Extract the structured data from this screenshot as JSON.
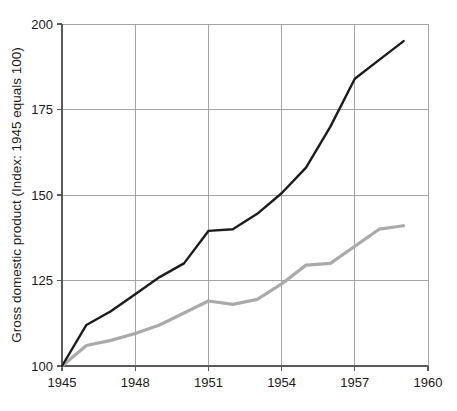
{
  "chart_data": {
    "type": "line",
    "title": "",
    "subtitle": "",
    "xlabel": "",
    "ylabel": "Gross domestic product (Index: 1945 equals 100)",
    "xlim": [
      1945,
      1960
    ],
    "ylim": [
      100,
      200
    ],
    "grid": true,
    "legend": "none",
    "x_ticks": [
      "1945",
      "1948",
      "1951",
      "1954",
      "1957",
      "1960"
    ],
    "x_tick_values": [
      1945,
      1948,
      1951,
      1954,
      1957,
      1960
    ],
    "y_ticks": [
      "100",
      "125",
      "150",
      "175",
      "200"
    ],
    "y_tick_values": [
      100,
      125,
      150,
      175,
      200
    ],
    "x": [
      1945,
      1946,
      1947,
      1948,
      1949,
      1950,
      1951,
      1952,
      1953,
      1954,
      1955,
      1956,
      1957,
      1958,
      1959
    ],
    "series": [
      {
        "name": "series-dark",
        "color": "#1c1c1c",
        "width": 2.4,
        "values": [
          100,
          112,
          116,
          121,
          126,
          130,
          139.5,
          140,
          144.5,
          150.5,
          158,
          170,
          184,
          189.5,
          195
        ]
      },
      {
        "name": "series-gray",
        "color": "#aaaaaa",
        "width": 3.2,
        "values": [
          100,
          106,
          107.5,
          109.5,
          112,
          115.5,
          119,
          118,
          119.5,
          124,
          129.5,
          130,
          135,
          140,
          141
        ]
      }
    ]
  },
  "colors": {
    "background": "#ffffff",
    "grid": "#9b9b9b",
    "axis": "#5a5a5a",
    "text": "#1a1a1a",
    "series_dark": "#1c1c1c",
    "series_gray": "#aaaaaa"
  }
}
